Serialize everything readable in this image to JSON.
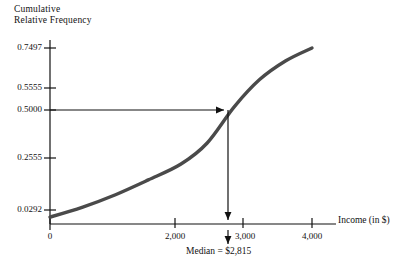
{
  "chart_data": {
    "type": "line",
    "title": "",
    "ylabel": "Cumulative Relative Frequency",
    "ylabel_line1": "Cumulative",
    "ylabel_line2": "Relative Frequency",
    "xlabel": "Income (in $)",
    "xlim": [
      0,
      4300
    ],
    "ylim": [
      0,
      0.8
    ],
    "grid": false,
    "legend": null,
    "ytick_labels": [
      "0.7497",
      "0.5555",
      "0.5000",
      "0.2555",
      "0.0292"
    ],
    "ytick_values": [
      0.7497,
      0.5555,
      0.5,
      0.2555,
      0.0292
    ],
    "xtick_labels": [
      "0",
      "2,000",
      "3,000",
      "4,000"
    ],
    "xtick_values": [
      0,
      2000,
      3000,
      4000
    ],
    "x": [
      0,
      500,
      1000,
      1500,
      2000,
      2400,
      2815,
      3200,
      3600,
      4000
    ],
    "y": [
      0.0292,
      0.072,
      0.125,
      0.188,
      0.2555,
      0.345,
      0.5,
      0.615,
      0.695,
      0.7497
    ],
    "series": [
      {
        "name": "Cumulative relative frequency ogive",
        "x": [
          0,
          500,
          1000,
          1500,
          2000,
          2400,
          2815,
          3200,
          3600,
          4000
        ],
        "values": [
          0.0292,
          0.072,
          0.125,
          0.188,
          0.2555,
          0.345,
          0.5,
          0.615,
          0.695,
          0.7497
        ],
        "color": "#4a4a4a"
      }
    ],
    "annotations": [
      {
        "name": "median-annotation",
        "text": "Median = $2,815",
        "x": 2815,
        "y": 0.5
      }
    ],
    "guide_lines": [
      {
        "name": "horizontal-median-guide",
        "from": [
          0,
          0.5
        ],
        "to": [
          2815,
          0.5
        ],
        "arrow": "end"
      },
      {
        "name": "vertical-median-guide",
        "from": [
          2815,
          0.5
        ],
        "to": [
          2815,
          0
        ],
        "arrow": "end"
      }
    ]
  },
  "axes": {
    "y_title_line1": "Cumulative",
    "y_title_line2": "Relative Frequency",
    "x_title": "Income (in $)",
    "y_ticks": [
      {
        "label": "0.7497"
      },
      {
        "label": "0.5555"
      },
      {
        "label": "0.5000"
      },
      {
        "label": "0.2555"
      },
      {
        "label": "0.0292"
      }
    ],
    "x_ticks": [
      {
        "label": "0"
      },
      {
        "label": "2,000"
      },
      {
        "label": "3,000"
      },
      {
        "label": "4,000"
      }
    ]
  },
  "annotation": {
    "median_text": "Median = $2,815"
  },
  "colors": {
    "curve": "#4a4a4a",
    "axis": "#111111",
    "text": "#111111",
    "background": "#ffffff"
  }
}
